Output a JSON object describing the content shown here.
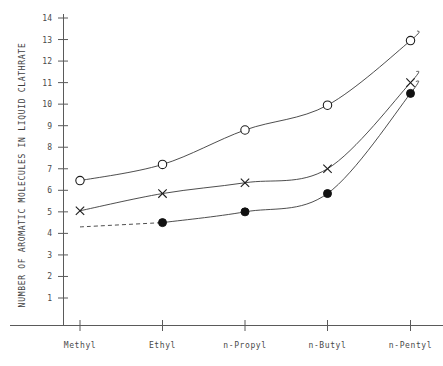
{
  "chart_data": {
    "type": "line",
    "title": "",
    "xlabel": "",
    "ylabel": "NUMBER OF AROMATIC MOLECULES IN LIQUID CLATHRATE",
    "categories": [
      "Methyl",
      "Ethyl",
      "n-Propyl",
      "n-Butyl",
      "n-Pentyl"
    ],
    "ylim": [
      0,
      14
    ],
    "yticks": [
      1,
      2,
      3,
      4,
      5,
      6,
      7,
      8,
      9,
      10,
      11,
      12,
      13,
      14
    ],
    "grid": false,
    "legend": "none",
    "series": [
      {
        "name": "open-circle-series",
        "marker": "open-circle",
        "linestyle": "solid",
        "values": [
          6.45,
          7.2,
          8.8,
          9.95,
          12.95
        ]
      },
      {
        "name": "cross-series",
        "marker": "cross",
        "linestyle": "solid",
        "values": [
          5.05,
          5.85,
          6.35,
          7.0,
          11.0
        ]
      },
      {
        "name": "filled-circle-series",
        "marker": "filled-circle",
        "linestyle": "solid-with-dashed-first-segment",
        "values": [
          4.3,
          4.5,
          5.0,
          5.85,
          10.5
        ]
      }
    ]
  },
  "colors": {
    "axis": "#5a5a5a",
    "curve": "#3a3a3a",
    "marker": "#1c1c1c",
    "text": "#4a4a4a",
    "background": "#ffffff"
  }
}
